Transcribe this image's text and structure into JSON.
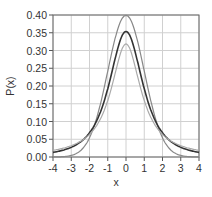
{
  "chart_data": {
    "type": "line",
    "title": "",
    "xlabel": "x",
    "ylabel": "P(x)",
    "xlim": [
      -4,
      4
    ],
    "ylim": [
      0,
      0.4
    ],
    "grid": true,
    "x_ticks": [
      "-4",
      "-3",
      "-2",
      "-1",
      "0",
      "1",
      "2",
      "3",
      "4"
    ],
    "y_ticks": [
      "0.00",
      "0.05",
      "0.10",
      "0.15",
      "0.20",
      "0.25",
      "0.30",
      "0.35",
      "0.40"
    ],
    "x": [
      -4,
      -3.5,
      -3,
      -2.5,
      -2,
      -1.5,
      -1,
      -0.5,
      0,
      0.5,
      1,
      1.5,
      2,
      2.5,
      3,
      3.5,
      4
    ],
    "series": [
      {
        "name": "normal",
        "color": "#888888",
        "values": [
          0.0001,
          0.0009,
          0.0044,
          0.0175,
          0.054,
          0.1295,
          0.242,
          0.3521,
          0.3989,
          0.3521,
          0.242,
          0.1295,
          0.054,
          0.0175,
          0.0044,
          0.0009,
          0.0001
        ]
      },
      {
        "name": "t (df=2)",
        "color": "#333333",
        "values": [
          0.0131,
          0.0175,
          0.0241,
          0.0344,
          0.068,
          0.1176,
          0.1925,
          0.2962,
          0.3536,
          0.2962,
          0.1925,
          0.1176,
          0.068,
          0.0344,
          0.0241,
          0.0175,
          0.0131
        ]
      },
      {
        "name": "cauchy",
        "color": "#aaaaaa",
        "values": [
          0.0187,
          0.024,
          0.0318,
          0.0439,
          0.0637,
          0.0979,
          0.1592,
          0.2546,
          0.3183,
          0.2546,
          0.1592,
          0.0979,
          0.0637,
          0.0439,
          0.0318,
          0.024,
          0.0187
        ]
      }
    ]
  }
}
